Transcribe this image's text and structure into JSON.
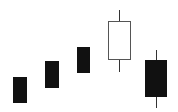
{
  "chart_data": {
    "type": "candlestick",
    "title": "",
    "xlabel": "",
    "ylabel": "",
    "grid": false,
    "legend": null,
    "ylim": [
      0,
      112
    ],
    "colors": {
      "bearish_fill": "#111111",
      "bullish_fill": "#ffffff",
      "bullish_border": "#555555",
      "wick": "#333333"
    },
    "candles": [
      {
        "index": 1,
        "type": "bearish",
        "open": 35,
        "close": 9,
        "high": 35,
        "low": 9,
        "x": 13,
        "w": 14
      },
      {
        "index": 2,
        "type": "bearish",
        "open": 51,
        "close": 24,
        "high": 51,
        "low": 24,
        "x": 45,
        "w": 14
      },
      {
        "index": 3,
        "type": "bearish",
        "open": 65,
        "close": 39,
        "high": 65,
        "low": 39,
        "x": 77,
        "w": 13
      },
      {
        "index": 4,
        "type": "bullish",
        "open": 52,
        "close": 91,
        "high": 102,
        "low": 40,
        "x": 108,
        "w": 23
      },
      {
        "index": 5,
        "type": "bearish",
        "open": 52,
        "close": 15,
        "high": 62,
        "low": 4,
        "x": 145,
        "w": 22
      }
    ]
  }
}
